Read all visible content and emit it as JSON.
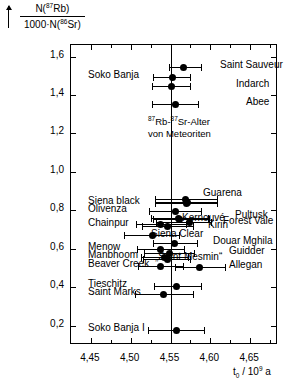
{
  "chart_data": {
    "type": "scatter",
    "annotation_line1": "Rb-",
    "annotation_line2": "von Meteoriten",
    "xlabel": "t₀ / 10⁹ a",
    "ylabel": "N(⁸⁷Rb) / 1000·N(⁸⁶Sr)",
    "ylabel_numerator": "N(",
    "ylabel_numerator_sup": "87",
    "ylabel_numerator_rest": "Rb)",
    "ylabel_denominator": "1000·N(",
    "ylabel_denominator_sup": "86",
    "ylabel_denominator_rest": "Sr)",
    "xlim": [
      4.425,
      4.685
    ],
    "ylim": [
      0.1,
      1.66
    ],
    "xticks": [
      4.45,
      4.5,
      4.55,
      4.6,
      4.65
    ],
    "xticklabels": [
      "4,45",
      "4,50",
      "4,55",
      "4,60",
      "4,65"
    ],
    "yticks": [
      0.2,
      0.4,
      0.6,
      0.8,
      1.0,
      1.2,
      1.4,
      1.6
    ],
    "yticklabels": [
      "0,2",
      "0,4",
      "0,6",
      "0,8",
      "1,0",
      "1,2",
      "1,4",
      "1,6"
    ],
    "reference_line_x": 4.55,
    "grid": false,
    "legend": "none",
    "marker_color": "#000000",
    "points": [
      {
        "name": "Saint Sauveur",
        "label_side": "right",
        "y": 1.545,
        "x": 4.566,
        "xlow": 4.548,
        "xhigh": 4.588
      },
      {
        "name": "Soko Banja",
        "label_side": "left",
        "y": 1.495,
        "x": 4.552,
        "xlow": 4.528,
        "xhigh": 4.574
      },
      {
        "name": "Indarch",
        "label_side": "right",
        "y": 1.448,
        "x": 4.551,
        "xlow": 4.527,
        "xhigh": 4.574
      },
      {
        "name": "Abee",
        "label_side": "right",
        "y": 1.352,
        "x": 4.556,
        "xlow": 4.527,
        "xhigh": 4.585
      },
      {
        "name": "Guarena",
        "label_side": "right",
        "y": 0.858,
        "x": 4.569,
        "xlow": 4.531,
        "xhigh": 4.609
      },
      {
        "name": "Guarena b",
        "label_side": "none",
        "y": 0.845,
        "x": 4.571,
        "xlow": 4.531,
        "xhigh": 4.609
      },
      {
        "name": "Siena black",
        "label_side": "left",
        "y": 0.838,
        "x": 4.57,
        "xlow": 4.53,
        "xhigh": 4.608
      },
      {
        "name": "Olivenza",
        "label_side": "left",
        "y": 0.795,
        "x": 4.556,
        "xlow": 4.523,
        "xhigh": 4.588
      },
      {
        "name": "Kernouvé",
        "label_side": "right",
        "y": 0.763,
        "x": 4.56,
        "xlow": 4.526,
        "xhigh": 4.597
      },
      {
        "name": "Pultusk",
        "label_side": "right",
        "y": 0.755,
        "x": 4.561,
        "xlow": 4.528,
        "xhigh": 4.598
      },
      {
        "name": "Forest Vale",
        "label_side": "right",
        "y": 0.74,
        "x": 4.574,
        "xlow": 4.532,
        "xhigh": 4.601
      },
      {
        "name": "Chainpur",
        "label_side": "left",
        "y": 0.728,
        "x": 4.538,
        "xlow": 4.507,
        "xhigh": 4.57
      },
      {
        "name": "Kirin",
        "label_side": "right",
        "y": 0.718,
        "x": 4.546,
        "xlow": 4.514,
        "xhigh": 4.578
      },
      {
        "name": "Siena Clear",
        "label_side": "right",
        "y": 0.672,
        "x": 4.527,
        "xlow": 4.492,
        "xhigh": 4.561
      },
      {
        "name": "Douar Mghila",
        "label_side": "right",
        "y": 0.63,
        "x": 4.555,
        "xlow": 4.528,
        "xhigh": 4.583
      },
      {
        "name": "Menow",
        "label_side": "left",
        "y": 0.6,
        "x": 4.537,
        "xlow": 4.508,
        "xhigh": 4.567
      },
      {
        "name": "Guidder",
        "label_side": "right",
        "y": 0.578,
        "x": 4.549,
        "xlow": 4.517,
        "xhigh": 4.579
      },
      {
        "name": "Manbhoom",
        "label_side": "left",
        "y": 0.558,
        "x": 4.543,
        "xlow": 4.513,
        "xhigh": 4.572
      },
      {
        "name": "Saint Mesmin",
        "label_side": "right",
        "y": 0.545,
        "x": 4.546,
        "xlow": 4.515,
        "xhigh": 4.574
      },
      {
        "name": "Beaver Creek",
        "label_side": "left",
        "y": 0.512,
        "x": 4.537,
        "xlow": 4.509,
        "xhigh": 4.566
      },
      {
        "name": "Allegan",
        "label_side": "right",
        "y": 0.508,
        "x": 4.586,
        "xlow": 4.556,
        "xhigh": 4.618
      },
      {
        "name": "Tieschitz",
        "label_side": "left",
        "y": 0.405,
        "x": 4.558,
        "xlow": 4.529,
        "xhigh": 4.588
      },
      {
        "name": "Saint Marks",
        "label_side": "left",
        "y": 0.365,
        "x": 4.541,
        "xlow": 4.505,
        "xhigh": 4.578
      },
      {
        "name": "Soko Banja I",
        "label_side": "left",
        "y": 0.178,
        "x": 4.557,
        "xlow": 4.522,
        "xhigh": 4.592
      }
    ],
    "labels_left": [
      "Soko Banja",
      "Siena black",
      "Olivenza",
      "Chainpur",
      "Menow",
      "Manbhoom",
      "Beaver Creek",
      "Tieschitz",
      "Saint Marks",
      "Soko Banja I"
    ],
    "labels_right": [
      "Saint Sauveur",
      "Indarch",
      "Abee",
      "Guarena",
      "Kernouvé",
      "Pultusk",
      "Forest Vale",
      "Kirin",
      "Siena Clear",
      "Douar Mghila",
      "Guidder",
      "„Saint Mesmin“",
      "Allegan"
    ]
  },
  "annotation": {
    "sup1": "87",
    "mid": "Rb-",
    "sup2": "87",
    "end": "Sr-Alter",
    "line2": "von Meteoriten"
  },
  "xaxis_title": {
    "base": "t",
    "sub": "0",
    "rest": " / 10",
    "sup": "9",
    "unit": " a"
  }
}
